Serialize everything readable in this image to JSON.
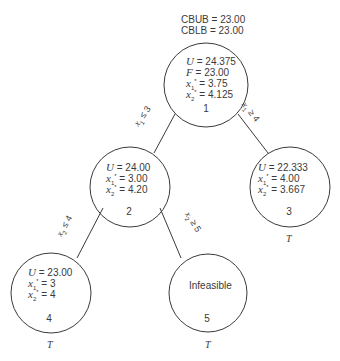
{
  "header": {
    "cbub": "CBUB = 23.00",
    "cblb": "CBLB = 23.00"
  },
  "nodes": [
    {
      "id": "1",
      "lines": [
        {
          "var": "U",
          "sub": "",
          "value": " = 24.375"
        },
        {
          "var": "F",
          "sub": "",
          "value": " = 23.00"
        },
        {
          "var": "x",
          "sub": "1",
          "value": " = 3.75"
        },
        {
          "var": "x",
          "sub": "2",
          "value": " = 4.125"
        }
      ],
      "number": "1",
      "terminal": ""
    },
    {
      "id": "2",
      "lines": [
        {
          "var": "U",
          "sub": "",
          "value": " = 24.00"
        },
        {
          "var": "x",
          "sub": "1",
          "value": " = 3.00"
        },
        {
          "var": "x",
          "sub": "2",
          "value": " = 4.20"
        }
      ],
      "number": "2",
      "terminal": ""
    },
    {
      "id": "3",
      "lines": [
        {
          "var": "U",
          "sub": "",
          "value": " = 22.333"
        },
        {
          "var": "x",
          "sub": "1",
          "value": " = 4.00"
        },
        {
          "var": "x",
          "sub": "2",
          "value": " = 3.667"
        }
      ],
      "number": "3",
      "terminal": "T"
    },
    {
      "id": "4",
      "lines": [
        {
          "var": "U",
          "sub": "",
          "value": " = 23.00"
        },
        {
          "var": "x",
          "sub": "1",
          "value": " = 3"
        },
        {
          "var": "x",
          "sub": "2",
          "value": " = 4"
        }
      ],
      "number": "4",
      "terminal": "T"
    },
    {
      "id": "5",
      "text": "Infeasible",
      "number": "5",
      "terminal": "T"
    }
  ],
  "edges": [
    {
      "from": "1",
      "to": "2",
      "var": "x",
      "sub": "1",
      "rel": " ≤ 3"
    },
    {
      "from": "1",
      "to": "3",
      "var": "x",
      "sub": "1",
      "rel": " ≥ 4"
    },
    {
      "from": "2",
      "to": "4",
      "var": "x",
      "sub": "2",
      "rel": " ≤ 4"
    },
    {
      "from": "2",
      "to": "5",
      "var": "x",
      "sub": "2",
      "rel": " ≥ 5"
    }
  ],
  "colors": {
    "line": "#3a3a3a",
    "background": "#ffffff"
  }
}
